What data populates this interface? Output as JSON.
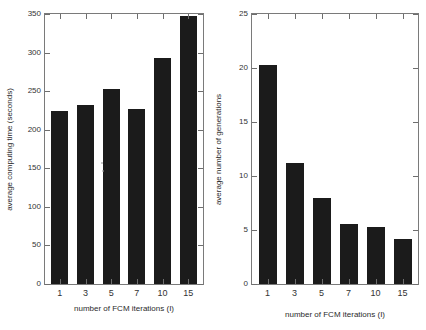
{
  "figure": {
    "background": "#ffffff",
    "bar_color": "#1b1b1b",
    "axis_color": "#7a7a7a"
  },
  "chart_data": [
    {
      "type": "bar",
      "title": "",
      "panel": "left",
      "categories": [
        "1",
        "3",
        "5",
        "7",
        "10",
        "15"
      ],
      "values": [
        224,
        232,
        253,
        227,
        293,
        347
      ],
      "xlabel": "number of FCM iterations (I)",
      "ylabel": "average computing time (seconds)",
      "ylim": [
        0,
        350
      ],
      "yticks": [
        0,
        50,
        100,
        150,
        200,
        250,
        300,
        350
      ],
      "ytick_labels": [
        "0",
        "50",
        "100",
        "150",
        "200",
        "250",
        "300",
        "350"
      ],
      "grid": false,
      "legend": null
    },
    {
      "type": "bar",
      "title": "",
      "panel": "right",
      "categories": [
        "1",
        "3",
        "5",
        "7",
        "10",
        "15"
      ],
      "values": [
        20.3,
        11.2,
        8.0,
        5.6,
        5.3,
        4.2
      ],
      "xlabel": "number of FCM iterations (I)",
      "ylabel": "average number of generations",
      "ylim": [
        0,
        25
      ],
      "yticks": [
        0,
        5,
        10,
        15,
        20,
        25
      ],
      "ytick_labels": [
        "0",
        "5",
        "10",
        "15",
        "20",
        "25"
      ],
      "grid": false,
      "legend": null
    }
  ]
}
